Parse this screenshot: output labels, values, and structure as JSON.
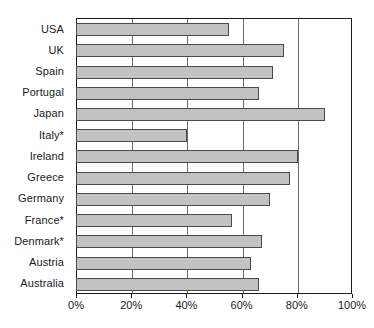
{
  "chart_data": {
    "type": "bar",
    "orientation": "horizontal",
    "title": "",
    "xlabel": "",
    "ylabel": "",
    "xlim": [
      0,
      100
    ],
    "xticks": [
      "0%",
      "20%",
      "40%",
      "60%",
      "80%",
      "100%"
    ],
    "xtick_values": [
      0,
      20,
      40,
      60,
      80,
      100
    ],
    "grid": true,
    "grid_axis": "x",
    "legend": false,
    "bar_color": "#c2c2c2",
    "bar_edge_color": "#4a4a4a",
    "axis_color": "#1a1a1a",
    "categories": [
      "USA",
      "UK",
      "Spain",
      "Portugal",
      "Japan",
      "Italy*",
      "Ireland",
      "Greece",
      "Germany",
      "France*",
      "Denmark*",
      "Austria",
      "Australia"
    ],
    "values": [
      55,
      75,
      71,
      66,
      90,
      40,
      80,
      77,
      70,
      56,
      67,
      63,
      66
    ],
    "value_labels": [
      "55%",
      "75%",
      "71%",
      "66%",
      "90%",
      "40%",
      "80%",
      "77%",
      "70%",
      "56%",
      "67%",
      "63%",
      "66%"
    ],
    "footnote_marker": "*"
  }
}
